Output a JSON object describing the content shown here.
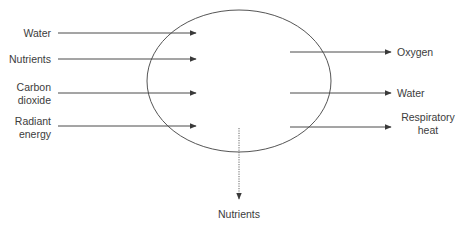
{
  "diagram": {
    "type": "process-flow",
    "colors": {
      "line": "#4a4a4a",
      "text": "#3c3c3c",
      "background": "#ffffff"
    },
    "inputs": [
      {
        "label": "Water"
      },
      {
        "label": "Nutrients"
      },
      {
        "label": "Carbon\ndioxide"
      },
      {
        "label": "Radiant\nenergy"
      }
    ],
    "outputs": [
      {
        "label": "Oxygen"
      },
      {
        "label": "Water"
      },
      {
        "label": "Respiratory\nheat"
      }
    ],
    "loss": {
      "label": "Nutrients",
      "style": "dotted"
    }
  }
}
